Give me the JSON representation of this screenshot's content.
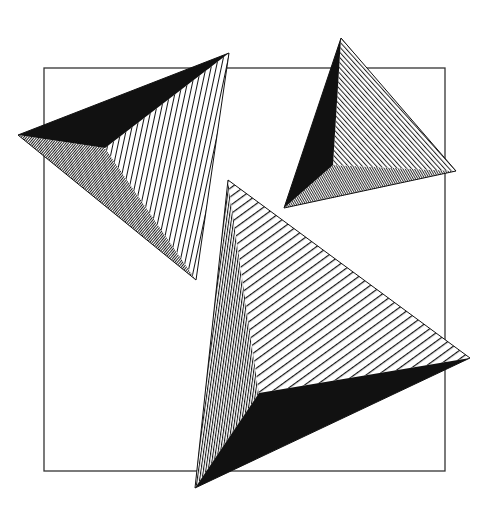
{
  "artwork": {
    "title": "Three hatched pyramids over a square frame",
    "colors": {
      "background": "#ffffff",
      "ink": "#111111",
      "frame": "#333333"
    },
    "frame": {
      "x": 44,
      "y": 68,
      "width": 401,
      "height": 403
    },
    "pyramids": [
      {
        "id": "pyramid-upper-left",
        "outer": [
          [
            18,
            135
          ],
          [
            229,
            53
          ],
          [
            196,
            280
          ]
        ],
        "apex": [
          105,
          148
        ],
        "faces": {
          "top": "solid",
          "right": "sparse-vertical",
          "bottom": "dense-diagonal"
        }
      },
      {
        "id": "pyramid-upper-right",
        "outer": [
          [
            341,
            38
          ],
          [
            456,
            171
          ],
          [
            284,
            208
          ]
        ],
        "apex": [
          333,
          165
        ],
        "faces": {
          "left": "solid",
          "right": "medium-diagonal",
          "bottom": "dense-diagonal"
        }
      },
      {
        "id": "pyramid-large",
        "outer": [
          [
            228,
            180
          ],
          [
            470,
            358
          ],
          [
            195,
            488
          ]
        ],
        "apex": [
          259,
          393
        ],
        "faces": {
          "left": "dense-vertical",
          "top": "sparse-diagonal",
          "bottom": "solid"
        }
      }
    ]
  }
}
